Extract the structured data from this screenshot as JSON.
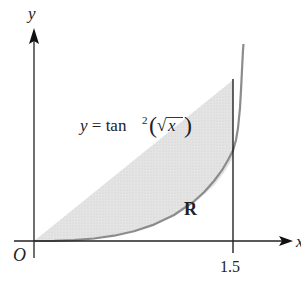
{
  "diagram": {
    "axes": {
      "x_label": "x",
      "y_label": "y",
      "origin_label": "O"
    },
    "curve": {
      "equation_prefix": "y = tan",
      "equation_exponent": "2",
      "equation_open": "(",
      "equation_radical": "√",
      "equation_var": "x",
      "equation_close": ")",
      "color": "#8a8a8a"
    },
    "region": {
      "label": "R",
      "fill": "#e2e2e2",
      "x_from": 0,
      "x_to": 1.5
    },
    "ticks": {
      "x_tick_label": "1.5"
    },
    "colors": {
      "axis": "#222222",
      "boundary": "#111111"
    }
  }
}
